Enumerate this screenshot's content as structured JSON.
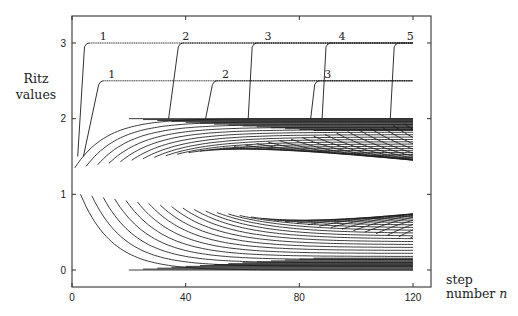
{
  "chart_data": {
    "type": "line",
    "title": "",
    "ylabel": [
      "Ritz",
      "values"
    ],
    "xlabel": [
      "step",
      "number n"
    ],
    "xlabel_italic_symbol": "n",
    "xlim": [
      0,
      125
    ],
    "ylim": [
      -0.35,
      3.35
    ],
    "x_ticks": [
      0,
      40,
      80,
      120
    ],
    "x_tick_labels": [
      "0",
      "40",
      "80",
      "120"
    ],
    "y_ticks": [
      0,
      1,
      2,
      3
    ],
    "y_tick_labels": [
      "0",
      "1",
      "2",
      "3"
    ],
    "grid": false,
    "legend": "none",
    "n_max": 120,
    "bulk_spectrum": {
      "description": "Ritz values of the matrix spectrum in [0, 2] converging over steps 1..120",
      "lower_edge": 0,
      "upper_edge": 2,
      "center_gap_value": 1.1,
      "curve_count_approx": 60
    },
    "outlier_series": [
      {
        "name": "eigenvalue 3",
        "value": 3,
        "copies": [
          {
            "label": "1",
            "start_step": 2,
            "settle_step": 5
          },
          {
            "label": "2",
            "start_step": 34,
            "settle_step": 38
          },
          {
            "label": "3",
            "start_step": 62,
            "settle_step": 64
          },
          {
            "label": "4",
            "start_step": 88,
            "settle_step": 90
          },
          {
            "label": "5",
            "start_step": 112,
            "settle_step": 114
          }
        ]
      },
      {
        "name": "eigenvalue 2.5",
        "value": 2.5,
        "copies": [
          {
            "label": "1",
            "start_step": 4,
            "settle_step": 10
          },
          {
            "label": "2",
            "start_step": 47,
            "settle_step": 50
          },
          {
            "label": "3",
            "start_step": 84,
            "settle_step": 86
          }
        ]
      }
    ],
    "annotations": [
      {
        "text": "1",
        "series": "eigenvalue 3",
        "step": 11
      },
      {
        "text": "2",
        "series": "eigenvalue 3",
        "step": 40
      },
      {
        "text": "3",
        "series": "eigenvalue 3",
        "step": 69
      },
      {
        "text": "4",
        "series": "eigenvalue 3",
        "step": 95
      },
      {
        "text": "5",
        "series": "eigenvalue 3",
        "step": 119
      },
      {
        "text": "1",
        "series": "eigenvalue 2.5",
        "step": 14
      },
      {
        "text": "2",
        "series": "eigenvalue 2.5",
        "step": 54
      },
      {
        "text": "3",
        "series": "eigenvalue 2.5",
        "step": 90
      }
    ]
  }
}
